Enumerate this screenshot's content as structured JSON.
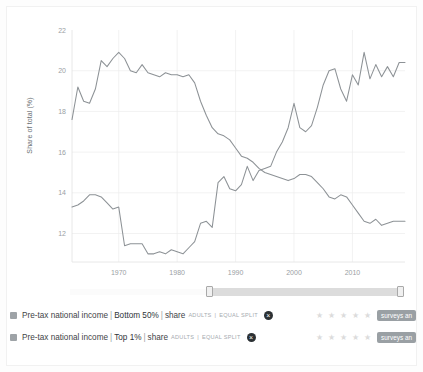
{
  "chart_data": {
    "type": "line",
    "title": "",
    "xlabel": "",
    "ylabel": "Share of total (%)",
    "xlim": [
      1962,
      2019
    ],
    "ylim": [
      10.6,
      22
    ],
    "grid": true,
    "legend_position": "below",
    "yticks": [
      "22",
      "20",
      "18",
      "16",
      "14",
      "12"
    ],
    "ytick_values": [
      22,
      20,
      18,
      16,
      14,
      12
    ],
    "xticks": [
      "1970",
      "1980",
      "1990",
      "2000",
      "2010"
    ],
    "xtick_values": [
      1970,
      1980,
      1990,
      2000,
      2010
    ],
    "x": [
      1962,
      1963,
      1964,
      1965,
      1966,
      1967,
      1968,
      1969,
      1970,
      1971,
      1972,
      1973,
      1974,
      1975,
      1976,
      1977,
      1978,
      1979,
      1980,
      1981,
      1982,
      1983,
      1984,
      1985,
      1986,
      1987,
      1988,
      1989,
      1990,
      1991,
      1992,
      1993,
      1994,
      1995,
      1996,
      1997,
      1998,
      1999,
      2000,
      2001,
      2002,
      2003,
      2004,
      2005,
      2006,
      2007,
      2008,
      2009,
      2010,
      2011,
      2012,
      2013,
      2014,
      2015,
      2016,
      2017,
      2018,
      2019
    ],
    "series": [
      {
        "name": "Pre-tax national income | Bottom 50% | share",
        "color": "#8d9296",
        "values": [
          17.6,
          19.2,
          18.5,
          18.4,
          19.1,
          20.5,
          20.2,
          20.6,
          20.9,
          20.6,
          20.0,
          19.9,
          20.3,
          19.9,
          19.8,
          19.7,
          19.9,
          19.8,
          19.8,
          19.7,
          19.8,
          19.4,
          18.5,
          17.8,
          17.2,
          16.9,
          16.8,
          16.6,
          16.2,
          15.8,
          15.7,
          15.5,
          15.2,
          15.0,
          14.9,
          14.8,
          14.7,
          14.6,
          14.7,
          14.9,
          14.9,
          14.8,
          14.5,
          14.2,
          13.8,
          13.7,
          13.9,
          13.8,
          13.4,
          13.0,
          12.6,
          12.5,
          12.7,
          12.4,
          12.5,
          12.6,
          12.6,
          12.6
        ]
      },
      {
        "name": "Pre-tax national income | Top 1% | share",
        "color": "#8d9296",
        "values": [
          13.3,
          13.4,
          13.6,
          13.9,
          13.9,
          13.8,
          13.5,
          13.2,
          13.3,
          11.4,
          11.5,
          11.5,
          11.5,
          11.0,
          11.0,
          11.1,
          11.0,
          11.2,
          11.1,
          11.0,
          11.3,
          11.6,
          12.5,
          12.6,
          12.3,
          14.5,
          14.8,
          14.2,
          14.1,
          14.4,
          15.3,
          14.6,
          15.1,
          15.2,
          15.3,
          16.0,
          16.5,
          17.2,
          18.4,
          17.2,
          17.0,
          17.3,
          18.2,
          19.3,
          20.0,
          20.1,
          19.1,
          18.5,
          19.8,
          19.3,
          20.9,
          19.6,
          20.3,
          19.7,
          20.2,
          19.7,
          20.4,
          20.4
        ]
      }
    ]
  },
  "slider": {
    "name": "time-range-slider",
    "left_handle_label": "",
    "right_handle_label": ""
  },
  "legend": {
    "rows": [
      {
        "indicator": "Pre-tax national income",
        "separator": "|",
        "group": "Bottom 50%",
        "measure": "share",
        "meta_population": "ADULTS",
        "meta_split": "EQUAL SPLIT",
        "remove_label": "×",
        "stars": "★ ★ ★ ★ ★",
        "source_label": "surveys an"
      },
      {
        "indicator": "Pre-tax national income",
        "separator": "|",
        "group": "Top 1%",
        "measure": "share",
        "meta_population": "ADULTS",
        "meta_split": "EQUAL SPLIT",
        "remove_label": "×",
        "stars": "★ ★ ★ ★ ★",
        "source_label": "surveys an"
      }
    ]
  }
}
